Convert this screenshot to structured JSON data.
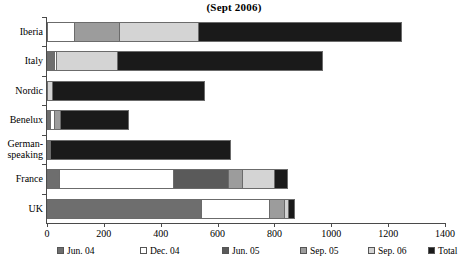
{
  "chart_data": {
    "type": "bar",
    "orientation": "horizontal",
    "stacked": true,
    "title": "(Sept 2006)",
    "xlabel": "",
    "ylabel": "",
    "xlim": [
      0,
      1400
    ],
    "xticks": [
      0,
      200,
      400,
      600,
      800,
      1000,
      1200,
      1400
    ],
    "xtick_labels": [
      "0",
      "200",
      "400",
      "600",
      "800",
      "1000",
      "1200",
      "1400"
    ],
    "grid": false,
    "legend_position": "bottom",
    "categories": [
      "Iberia",
      "Italy",
      "Nordic",
      "Benelux",
      "German-speaking",
      "France",
      "UK"
    ],
    "series": [
      {
        "name": "Jun. 04",
        "color": "#6e6e6e",
        "values": [
          0,
          25,
          0,
          10,
          12,
          42,
          540
        ]
      },
      {
        "name": "Dec. 04",
        "color": "#ffffff",
        "values": [
          95,
          8,
          0,
          14,
          0,
          400,
          240
        ]
      },
      {
        "name": "Jun. 05",
        "color": "#5a5a5a",
        "values": [
          0,
          0,
          0,
          0,
          0,
          195,
          0
        ]
      },
      {
        "name": "Sep. 05",
        "color": "#9c9c9c",
        "values": [
          160,
          0,
          0,
          22,
          0,
          48,
          53
        ]
      },
      {
        "name": "Sep. 06",
        "color": "#d4d4d4",
        "values": [
          275,
          215,
          18,
          0,
          0,
          112,
          14
        ]
      },
      {
        "name": "Total",
        "color": "#1a1a1a",
        "values": [
          720,
          722,
          537,
          242,
          636,
          50,
          25
        ]
      }
    ],
    "totals": [
      1250,
      970,
      555,
      288,
      648,
      847,
      872
    ],
    "annotations": []
  },
  "legend": {
    "items": [
      {
        "label": "Jun. 04",
        "color": "#6e6e6e"
      },
      {
        "label": "Dec. 04",
        "color": "#ffffff"
      },
      {
        "label": "Jun. 05",
        "color": "#5a5a5a"
      },
      {
        "label": "Sep. 05",
        "color": "#9c9c9c"
      },
      {
        "label": "Sep. 06",
        "color": "#d4d4d4"
      },
      {
        "label": "Total",
        "color": "#1a1a1a"
      }
    ]
  },
  "category_labels": [
    {
      "lines": [
        "Iberia"
      ]
    },
    {
      "lines": [
        "Italy"
      ]
    },
    {
      "lines": [
        "Nordic"
      ]
    },
    {
      "lines": [
        "Benelux"
      ]
    },
    {
      "lines": [
        "German-",
        "speaking"
      ]
    },
    {
      "lines": [
        "France"
      ]
    },
    {
      "lines": [
        "UK"
      ]
    }
  ]
}
